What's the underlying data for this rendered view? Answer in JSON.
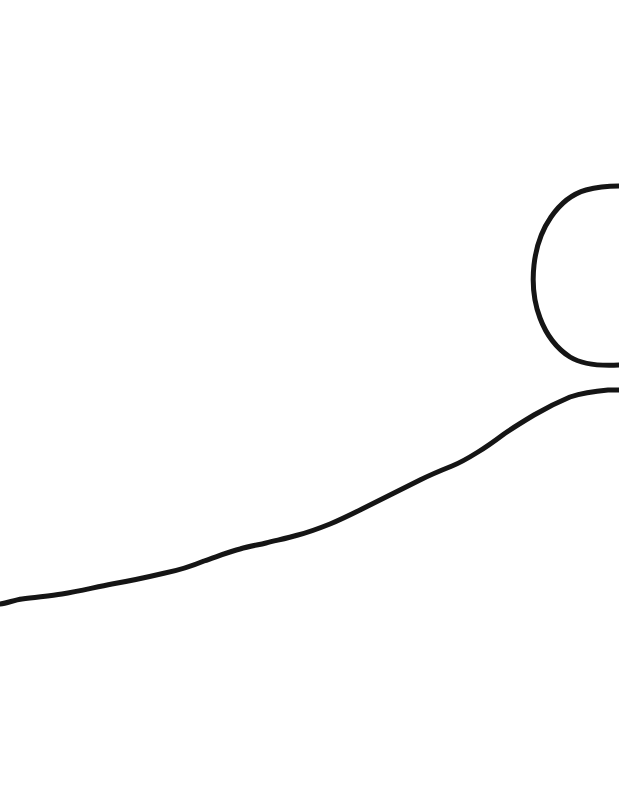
{
  "canvas": {
    "width": 619,
    "height": 791,
    "background_color": "#ffffff",
    "title": "",
    "caption": "",
    "medium": "ink line drawing"
  },
  "ink": {
    "color": "#151515",
    "stroke_width_arc": 5,
    "stroke_width_line": 5,
    "line_cap": "round"
  },
  "strokes": [
    {
      "name": "circle-arc",
      "role": "large open circular arc at upper right, opening toward the right edge",
      "stroke_width": 5,
      "color": "#151515",
      "extent": {
        "x_min": 533,
        "x_max": 619,
        "y_min": 185,
        "y_max": 366
      },
      "path": "M 619 186 C 610 186 597 187 586 190 C 572 194 560 204 551 217 C 542 230 536 247 534 265 C 532 283 534 302 540 318 C 546 334 556 348 570 357 C 583 365 601 366 619 365"
    },
    {
      "name": "horizon-line",
      "role": "long gently rising wavy line crossing the lower half from left edge to right edge",
      "stroke_width": 5,
      "color": "#151515",
      "extent": {
        "x_min": 0,
        "x_max": 619,
        "y_min": 390,
        "y_max": 606
      },
      "path": "M 0 604 C 8 603 14 600 22 599 C 36 597 50 596 62 594 C 80 591 96 587 112 584 C 130 581 148 577 165 573 C 180 570 192 566 204 561 C 216 557 228 552 240 549 C 250 546 258 545 266 543 C 278 540 288 538 298 535 C 310 532 320 528 330 524 C 342 519 352 514 362 509 C 374 503 384 498 394 493 C 404 488 412 484 420 480 C 432 474 442 470 452 466 C 462 462 470 457 478 452 C 488 446 496 440 504 434 C 514 427 524 421 534 415 C 546 408 558 402 570 397 C 582 393 596 391 608 390 C 613 390 616 390 619 390"
    }
  ],
  "features": {
    "shape_names": [
      "arc",
      "line"
    ],
    "shape_count": 2,
    "text_present": false,
    "labels": [],
    "annotations": []
  }
}
